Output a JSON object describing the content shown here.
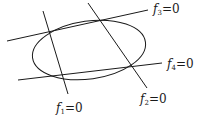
{
  "diagram": {
    "stroke_color": "#1a1a1a",
    "ellipse": {
      "cx": 89,
      "cy": 50,
      "rx": 57,
      "ry": 29,
      "rotate": -8
    },
    "lines": [
      {
        "id": "f1",
        "x1": 43,
        "y1": 11,
        "x2": 68,
        "y2": 94,
        "label": {
          "f": "f",
          "sub": "1",
          "eq": "=0",
          "x": 56,
          "y": 112
        }
      },
      {
        "id": "f2",
        "x1": 88,
        "y1": 3,
        "x2": 147,
        "y2": 88,
        "label": {
          "f": "f",
          "sub": "2",
          "eq": "=0",
          "x": 140,
          "y": 103
        }
      },
      {
        "id": "f3",
        "x1": 7,
        "y1": 41,
        "x2": 148,
        "y2": 10,
        "label": {
          "f": "f",
          "sub": "3",
          "eq": "=0",
          "x": 153,
          "y": 13
        }
      },
      {
        "id": "f4",
        "x1": 18,
        "y1": 80,
        "x2": 162,
        "y2": 63,
        "label": {
          "f": "f",
          "sub": "4",
          "eq": "=0",
          "x": 167,
          "y": 68
        }
      }
    ]
  }
}
